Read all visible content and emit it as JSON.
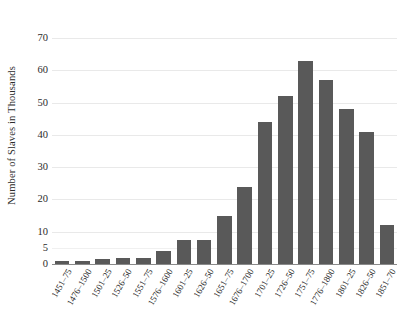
{
  "chart_data": {
    "type": "bar",
    "title": "",
    "subtitle": "",
    "xlabel": "",
    "ylabel": "Number of Slaves in Thousands",
    "categories": [
      "1451–75",
      "1476–1500",
      "1501–25",
      "1526–50",
      "1551–75",
      "1576–1600",
      "1601–25",
      "1626–50",
      "1651–75",
      "1676–1700",
      "1701–25",
      "1726–50",
      "1751–75",
      "1776–1800",
      "1801–25",
      "1826–50",
      "1851–70"
    ],
    "values": [
      1,
      1,
      1.5,
      2,
      2,
      4,
      7.5,
      7.5,
      15,
      24,
      44,
      52,
      63,
      57,
      48,
      41,
      12
    ],
    "ylim": [
      0,
      70
    ],
    "yticks": [
      0,
      5,
      10,
      20,
      30,
      40,
      50,
      60,
      70
    ],
    "ytick_labels": [
      "0",
      "5",
      "10",
      "20",
      "30",
      "40",
      "50",
      "60",
      "70"
    ],
    "grid": true,
    "grid_axis": "y",
    "legend": false,
    "legend_position": "none",
    "bar_color": "#595959",
    "gridline_color": "#e9e9e9",
    "axis_color": "#8a8a8a",
    "text_color": "#2b2b2b",
    "background_color": "#ffffff",
    "xtick_rotation_degrees": -60
  }
}
